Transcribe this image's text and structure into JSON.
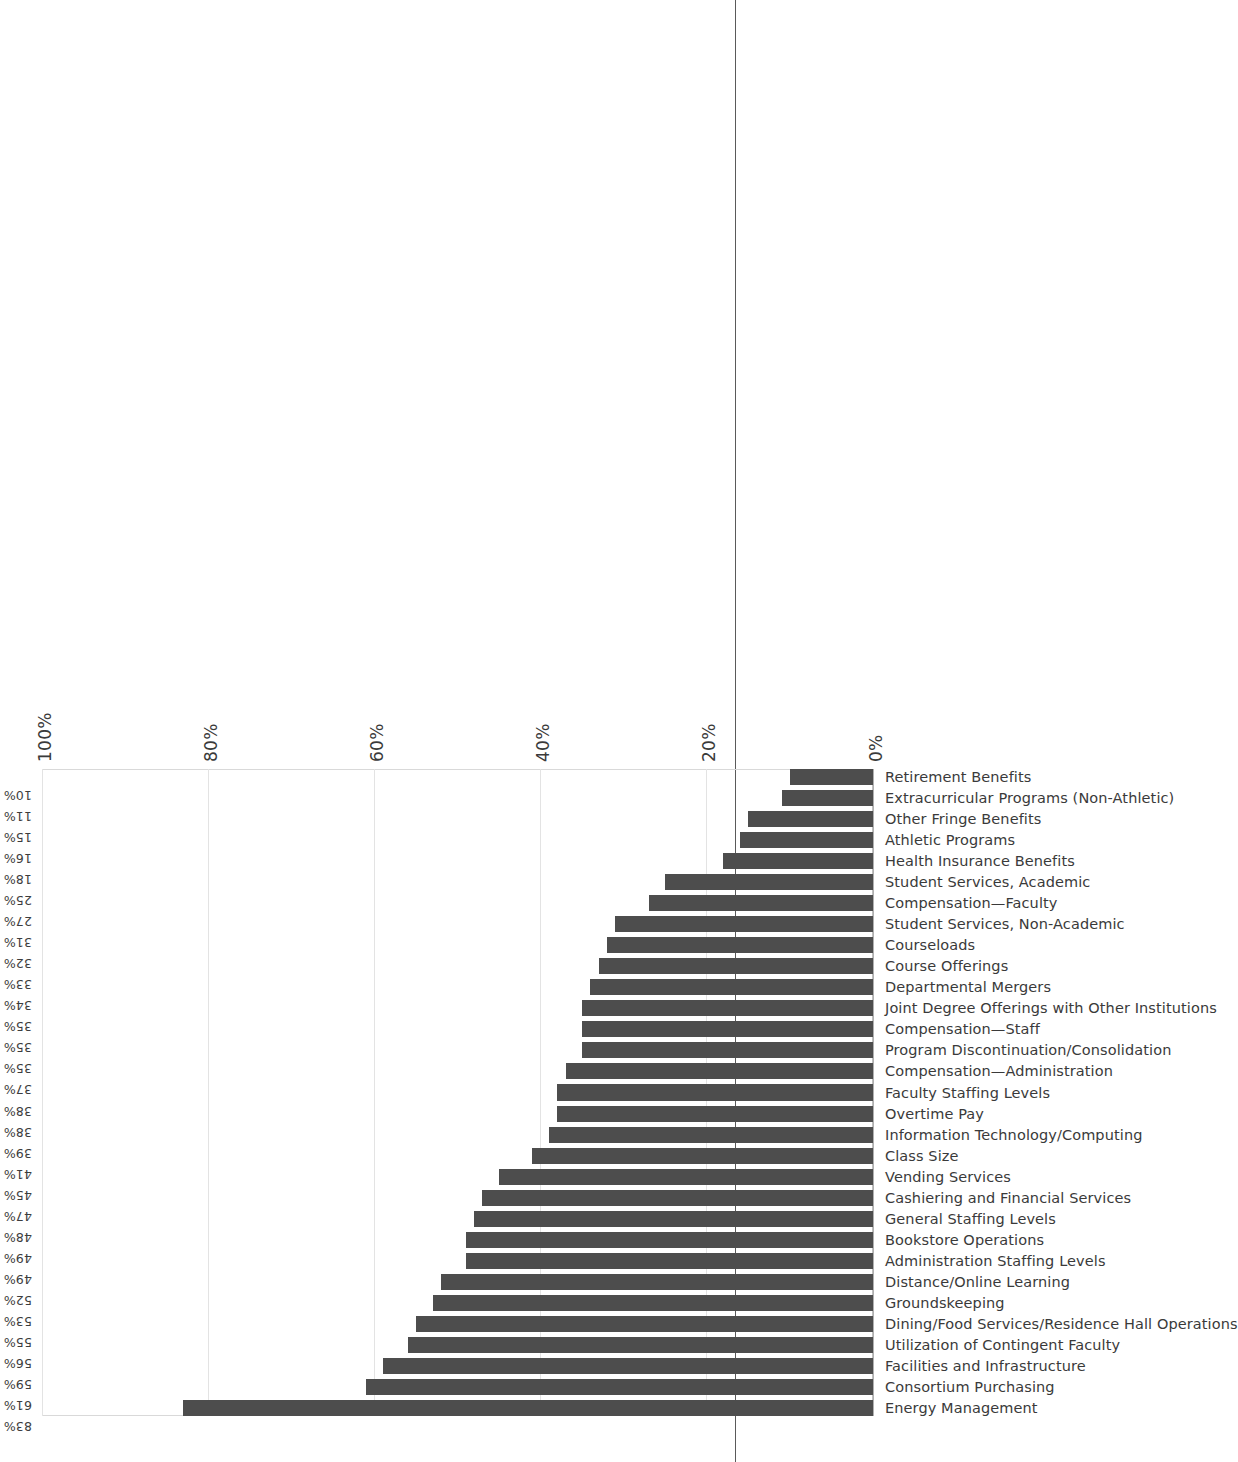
{
  "chart_data": {
    "type": "bar",
    "title": "",
    "subtitle": "",
    "xlabel": "",
    "ylabel": "",
    "ylim": [
      0,
      100
    ],
    "grid": true,
    "legend": false,
    "orientation": "vertical-bars-on-sideways-page",
    "value_suffix": "%",
    "axis_ticks": [
      "0%",
      "20%",
      "40%",
      "60%",
      "80%",
      "100%"
    ],
    "axis_tick_values": [
      0,
      20,
      40,
      60,
      80,
      100
    ],
    "categories": [
      "Energy Management",
      "Consortium Purchasing",
      "Facilities and Infrastructure",
      "Utilization of Contingent Faculty",
      "Dining/Food Services/Residence Hall Operations",
      "Groundskeeping",
      "Distance/Online Learning",
      "Administration Staffing Levels",
      "Bookstore Operations",
      "General Staffing Levels",
      "Cashiering and Financial Services",
      "Vending Services",
      "Class Size",
      "Information Technology/Computing",
      "Overtime Pay",
      "Faculty Staffing Levels",
      "Compensation—Administration",
      "Program Discontinuation/Consolidation",
      "Compensation—Staff",
      "Joint Degree Offerings with Other Institutions",
      "Departmental Mergers",
      "Course Offerings",
      "Courseloads",
      "Student Services, Non-Academic",
      "Compensation—Faculty",
      "Student Services, Academic",
      "Health Insurance Benefits",
      "Athletic Programs",
      "Other Fringe Benefits",
      "Extracurricular Programs (Non-Athletic)",
      "Retirement Benefits"
    ],
    "values": [
      83,
      61,
      59,
      56,
      55,
      53,
      52,
      49,
      49,
      48,
      47,
      45,
      41,
      39,
      38,
      38,
      37,
      35,
      35,
      35,
      34,
      33,
      32,
      31,
      27,
      25,
      18,
      16,
      15,
      11,
      10
    ],
    "value_labels": [
      "83%",
      "61%",
      "59%",
      "56%",
      "55%",
      "53%",
      "52%",
      "49%",
      "49%",
      "48%",
      "47%",
      "45%",
      "41%",
      "39%",
      "38%",
      "38%",
      "37%",
      "35%",
      "35%",
      "35%",
      "34%",
      "33%",
      "32%",
      "31%",
      "27%",
      "25%",
      "18%",
      "16%",
      "15%",
      "11%",
      "10%"
    ],
    "colors": {
      "bar": "#4d4d4d",
      "gridline": "#e3e3e3",
      "axis": "#b0b0b0",
      "text": "#3a3a3a",
      "background": "#ffffff"
    }
  }
}
